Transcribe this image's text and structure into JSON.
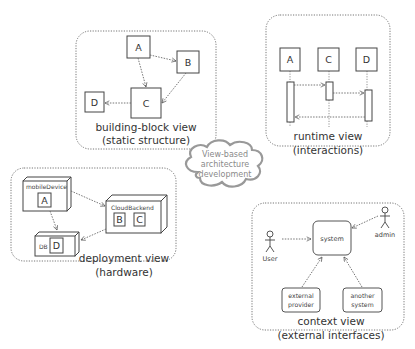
{
  "diagram": {
    "center": {
      "shape": "cloud",
      "lines": [
        "View-based",
        "architecture",
        "development"
      ]
    },
    "panels": {
      "building_block": {
        "title": "building-block view",
        "subtitle": "(static structure)",
        "boxes": [
          "A",
          "B",
          "C",
          "D"
        ],
        "edges": [
          {
            "from": "A",
            "to": "B"
          },
          {
            "from": "A",
            "to": "C"
          },
          {
            "from": "B",
            "to": "C"
          },
          {
            "from": "C",
            "to": "D"
          }
        ]
      },
      "runtime": {
        "title": "runtime view",
        "subtitle": "(interactions)",
        "participants": [
          "A",
          "C",
          "D"
        ],
        "messages": [
          {
            "from": "A",
            "to": "C"
          },
          {
            "from": "C",
            "to": "D"
          },
          {
            "from": "D",
            "to": "A"
          }
        ]
      },
      "deployment": {
        "title": "deployment view",
        "subtitle": "(hardware)",
        "nodes": [
          {
            "name": "mobileDevice",
            "contains": [
              "A"
            ]
          },
          {
            "name": "CloudBackend",
            "contains": [
              "B",
              "C"
            ]
          },
          {
            "name": "DB",
            "contains": [
              "D"
            ]
          }
        ],
        "edges": [
          {
            "from": "mobileDevice",
            "to": "CloudBackend"
          },
          {
            "from": "mobileDevice",
            "to": "DB"
          },
          {
            "from": "CloudBackend",
            "to": "DB"
          }
        ]
      },
      "context": {
        "title": "context view",
        "subtitle": "(external interfaces)",
        "system": "system",
        "actors": [
          "User",
          "admin"
        ],
        "external_systems": [
          {
            "lines": [
              "external",
              "provider"
            ]
          },
          {
            "lines": [
              "another",
              "system"
            ]
          }
        ]
      }
    }
  }
}
